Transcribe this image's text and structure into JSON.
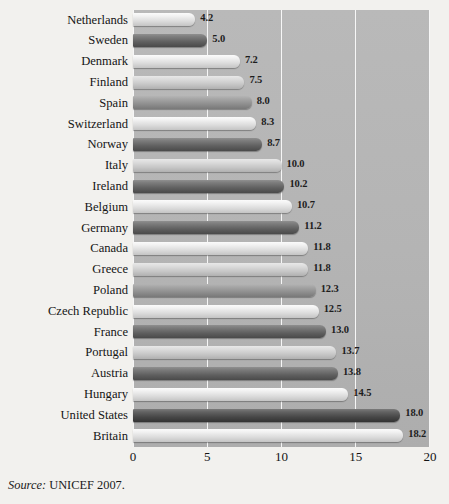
{
  "source": {
    "prefix": "Source:",
    "text": "UNICEF 2007."
  },
  "axis": {
    "ticks": [
      "0",
      "5",
      "10",
      "15",
      "20"
    ],
    "tick_values": [
      0,
      5,
      10,
      15,
      20
    ]
  },
  "colors": {
    "plot_background": "#b4b4b4",
    "gridline": "#ffffff",
    "page_background": "#f2f1ee",
    "text": "#151515"
  },
  "chart_data": {
    "type": "bar",
    "orientation": "horizontal",
    "title": "",
    "xlabel": "",
    "ylabel": "",
    "xlim": [
      0,
      20
    ],
    "grid": true,
    "legend": false,
    "categories": [
      "Netherlands",
      "Sweden",
      "Denmark",
      "Finland",
      "Spain",
      "Switzerland",
      "Norway",
      "Italy",
      "Ireland",
      "Belgium",
      "Germany",
      "Canada",
      "Greece",
      "Poland",
      "Czech Republic",
      "France",
      "Portugal",
      "Austria",
      "Hungary",
      "United States",
      "Britain"
    ],
    "values": [
      4.2,
      5.0,
      7.2,
      7.5,
      8.0,
      8.3,
      8.7,
      10.0,
      10.2,
      10.7,
      11.2,
      11.8,
      11.8,
      12.3,
      12.5,
      13.0,
      13.7,
      13.8,
      14.5,
      18.0,
      18.2
    ],
    "value_labels": [
      "4.2",
      "5.0",
      "7.2",
      "7.5",
      "8.0",
      "8.3",
      "8.7",
      "10.0",
      "10.2",
      "10.7",
      "11.2",
      "11.8",
      "11.8",
      "12.3",
      "12.5",
      "13.0",
      "13.7",
      "13.8",
      "14.5",
      "18.0",
      "18.2"
    ],
    "bar_shades": [
      0,
      1,
      0,
      2,
      3,
      0,
      1,
      2,
      1,
      0,
      1,
      0,
      2,
      3,
      0,
      1,
      2,
      1,
      0,
      4,
      0
    ]
  }
}
